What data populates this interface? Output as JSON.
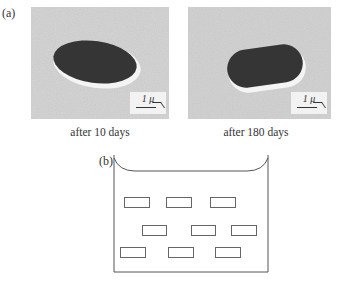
{
  "figure": {
    "panel_a": {
      "label": "(a)",
      "micrographs": [
        {
          "caption": "after 10 days",
          "scale_bar": "1 μ",
          "particle_shape": "ellipse"
        },
        {
          "caption": "after 180 days",
          "scale_bar": "1 μ",
          "particle_shape": "rounded-capsule"
        }
      ]
    },
    "panel_b": {
      "label": "(b)",
      "diagram": "container with liquid and suspended rectangular specimens",
      "specimen_rows": [
        3,
        3,
        3
      ]
    },
    "colors": {
      "background": "#ffffff",
      "matrix": "#c9c9c9",
      "particle": "#333333",
      "halo": "#f5f5f5",
      "line": "#555555"
    }
  }
}
